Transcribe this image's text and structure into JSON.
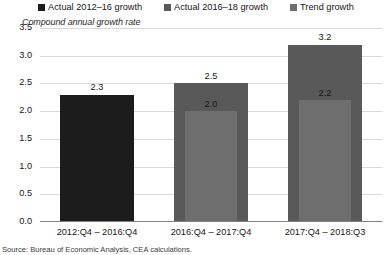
{
  "chart_data": {
    "type": "bar",
    "title": "",
    "subtitle": "",
    "ylabel": "Compound annual growth rate",
    "xlabel": "",
    "ylim": [
      0.0,
      3.5
    ],
    "ytick_labels": [
      "3.5",
      "3.0",
      "2.5",
      "2.0",
      "1.5",
      "1.0",
      "0.5",
      "0.0"
    ],
    "ytick_values": [
      3.5,
      3.0,
      2.5,
      2.0,
      1.5,
      1.0,
      0.5,
      0.0
    ],
    "grid": true,
    "legend_position": "top",
    "categories": [
      "2012:Q4 – 2016:Q4",
      "2016:Q4 – 2017:Q4",
      "2017:Q4 – 2018:Q3"
    ],
    "series": [
      {
        "name": "Actual 2012–16 growth",
        "color": "#1c1c1c",
        "values": [
          2.3,
          null,
          null
        ],
        "labels": [
          "2.3",
          "",
          ""
        ]
      },
      {
        "name": "Actual 2016–18 growth",
        "color": "#595959",
        "values": [
          null,
          2.5,
          3.2
        ],
        "labels": [
          "",
          "2.5",
          "3.2"
        ]
      },
      {
        "name": "Trend growth",
        "color": "#6e6e6e",
        "values": [
          null,
          2.0,
          2.2
        ],
        "labels": [
          "",
          "2.0",
          "2.2"
        ]
      }
    ],
    "bars": [
      {
        "category": "2012:Q4 – 2016:Q4",
        "outer": {
          "series": "Actual 2012–16 growth",
          "value": 2.3,
          "label": "2.3",
          "color": "#1c1c1c"
        },
        "inner": null
      },
      {
        "category": "2016:Q4 – 2017:Q4",
        "outer": {
          "series": "Actual 2016–18 growth",
          "value": 2.5,
          "label": "2.5",
          "color": "#595959"
        },
        "inner": {
          "series": "Trend growth",
          "value": 2.0,
          "label": "2.0",
          "color": "#6e6e6e"
        }
      },
      {
        "category": "2017:Q4 – 2018:Q3",
        "outer": {
          "series": "Actual 2016–18 growth",
          "value": 3.2,
          "label": "3.2",
          "color": "#595959"
        },
        "inner": {
          "series": "Trend growth",
          "value": 2.2,
          "label": "2.2",
          "color": "#6e6e6e"
        }
      }
    ]
  },
  "legend": {
    "items": [
      {
        "label": "Actual 2012–16 growth",
        "color": "#1c1c1c",
        "marker": "square-marker"
      },
      {
        "label": "Actual 2016–18 growth",
        "color": "#595959",
        "marker": "square-marker"
      },
      {
        "label": "Trend growth",
        "color": "#6e6e6e",
        "marker": "square-marker"
      }
    ]
  },
  "axis": {
    "y_title": "Compound annual growth rate",
    "ticks": [
      "3.5",
      "3.0",
      "2.5",
      "2.0",
      "1.5",
      "1.0",
      "0.5",
      "0.0"
    ]
  },
  "footer": {
    "source": "Source: Bureau of Economic Analysis, CEA calculations."
  },
  "colors": {
    "series_1": "#1c1c1c",
    "series_2": "#595959",
    "series_3": "#6e6e6e",
    "gridline": "#d9d9d9",
    "baseline": "#808080",
    "background": "#ffffff"
  }
}
